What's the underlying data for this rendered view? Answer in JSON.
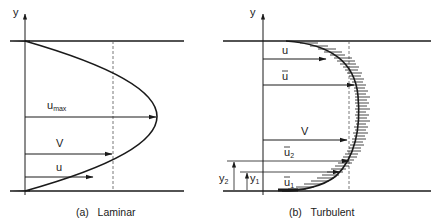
{
  "panels": {
    "laminar": {
      "caption": "(a)   Laminar",
      "axis_label": "y",
      "labels": {
        "umax_base": "u",
        "umax_sub": "max",
        "V": "V",
        "u": "u"
      }
    },
    "turbulent": {
      "caption": "(b)   Turbulent",
      "axis_label": "y",
      "labels": {
        "u": "u",
        "ubar": "u",
        "V": "V",
        "ubar2_base": "u",
        "ubar2_sub": "2",
        "ubar1_base": "u",
        "ubar1_sub": "1",
        "y2_base": "y",
        "y2_sub": "2",
        "y1_base": "y",
        "y1_sub": "1"
      }
    }
  },
  "colors": {
    "ink": "#1a1a1a",
    "background": "#ffffff",
    "dashed": "#555555"
  }
}
